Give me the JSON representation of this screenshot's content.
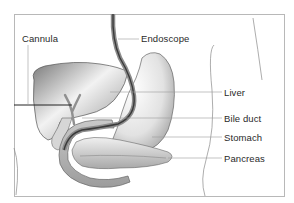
{
  "diagram": {
    "title": "",
    "labels": {
      "cannula": "Cannula",
      "endoscope": "Endoscope",
      "liver": "Liver",
      "bile_duct": "Bile duct",
      "stomach": "Stomach",
      "pancreas": "Pancreas"
    },
    "colors": {
      "background": "#ffffff",
      "frame": "#b8b8b8",
      "organ_fill": "#e6e6e6",
      "organ_shadow": "#8a8a8a",
      "endoscope": "#707070",
      "cannula": "#222222",
      "leader_line": "#9a9a9a",
      "text": "#2a2a2a"
    }
  }
}
